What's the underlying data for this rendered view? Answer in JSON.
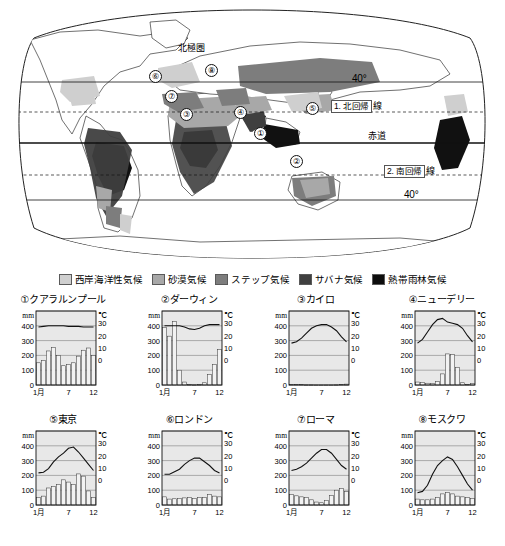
{
  "map": {
    "labels": [
      {
        "name": "arctic-circle",
        "text": "北極圏",
        "x": 178,
        "y": 44
      },
      {
        "name": "latitude-40-north",
        "text": "40°",
        "x": 352,
        "y": 78
      },
      {
        "name": "tropic-of-cancer",
        "prefix": "1. 北回帰",
        "suffix": "線",
        "x": 331,
        "y": 103
      },
      {
        "name": "equator",
        "text": "赤道",
        "x": 368,
        "y": 140
      },
      {
        "name": "tropic-of-capricorn",
        "prefix": "2. 南回帰",
        "suffix": "線",
        "x": 384,
        "y": 168
      },
      {
        "name": "latitude-40-south",
        "text": "40°",
        "x": 404,
        "y": 192
      }
    ],
    "markers": [
      {
        "id": "1",
        "label": "①",
        "x": 254,
        "y": 127
      },
      {
        "id": "2",
        "label": "②",
        "x": 290,
        "y": 155
      },
      {
        "id": "3",
        "label": "③",
        "x": 180,
        "y": 108
      },
      {
        "id": "4",
        "label": "④",
        "x": 234,
        "y": 106
      },
      {
        "id": "5",
        "label": "⑤",
        "x": 306,
        "y": 102
      },
      {
        "id": "6",
        "label": "⑥",
        "x": 149,
        "y": 70
      },
      {
        "id": "7",
        "label": "⑦",
        "x": 165,
        "y": 90
      },
      {
        "id": "8",
        "label": "⑧",
        "x": 205,
        "y": 64
      }
    ]
  },
  "legend": {
    "items": [
      {
        "label": "西岸海洋性気候",
        "color": "#cfcfcf"
      },
      {
        "label": "砂漠気候",
        "color": "#a8a8a8"
      },
      {
        "label": "ステップ気候",
        "color": "#7d7d7d"
      },
      {
        "label": "サバナ気候",
        "color": "#3f3f3f"
      },
      {
        "label": "熱帯雨林気候",
        "color": "#0d0d0d"
      }
    ]
  },
  "chart_common": {
    "type": "bar",
    "left_axis_unit": "mm",
    "right_axis_unit": "℃",
    "left_ticks": [
      "400",
      "300",
      "200",
      "100",
      "0"
    ],
    "right_ticks": [
      "30",
      "20",
      "10",
      "0"
    ],
    "x_ticks": [
      "1月",
      "7",
      "12"
    ],
    "precip_range": [
      0,
      500
    ],
    "temp_range": [
      -20,
      40
    ],
    "grid": true,
    "legend_position": "none"
  },
  "chart_data": [
    {
      "type": "bar",
      "id": "1",
      "title": "①クアラルンプール",
      "city": "クアラルンプール",
      "categories": [
        "1",
        "2",
        "3",
        "4",
        "5",
        "6",
        "7",
        "8",
        "9",
        "10",
        "11",
        "12"
      ],
      "series": [
        {
          "name": "降水量",
          "unit": "mm",
          "type": "bar",
          "values": [
            150,
            165,
            230,
            255,
            200,
            130,
            140,
            150,
            195,
            235,
            250,
            200
          ]
        },
        {
          "name": "気温",
          "unit": "℃",
          "type": "line",
          "values": [
            27,
            27.5,
            28,
            28,
            28,
            28,
            27.5,
            27.5,
            27.5,
            27,
            27,
            27
          ]
        }
      ],
      "xlabel": "",
      "ylabel": "mm",
      "y2label": "℃",
      "ylim": [
        0,
        500
      ],
      "y2lim": [
        -20,
        40
      ]
    },
    {
      "type": "bar",
      "id": "2",
      "title": "②ダーウィン",
      "city": "ダーウィン",
      "categories": [
        "1",
        "2",
        "3",
        "4",
        "5",
        "6",
        "7",
        "8",
        "9",
        "10",
        "11",
        "12"
      ],
      "series": [
        {
          "name": "降水量",
          "unit": "mm",
          "type": "bar",
          "values": [
            390,
            330,
            430,
            100,
            20,
            2,
            1,
            2,
            15,
            70,
            140,
            240
          ]
        },
        {
          "name": "気温",
          "unit": "℃",
          "type": "line",
          "values": [
            28,
            28,
            28,
            28,
            27,
            25.5,
            25,
            26,
            28,
            29,
            29,
            29
          ]
        }
      ],
      "xlabel": "",
      "ylabel": "mm",
      "y2label": "℃",
      "ylim": [
        0,
        500
      ],
      "y2lim": [
        -20,
        40
      ]
    },
    {
      "type": "bar",
      "id": "3",
      "title": "③カイロ",
      "city": "カイロ",
      "categories": [
        "1",
        "2",
        "3",
        "4",
        "5",
        "6",
        "7",
        "8",
        "9",
        "10",
        "11",
        "12"
      ],
      "series": [
        {
          "name": "降水量",
          "unit": "mm",
          "type": "bar",
          "values": [
            5,
            4,
            4,
            1,
            1,
            0,
            0,
            0,
            0,
            1,
            3,
            6
          ]
        },
        {
          "name": "気温",
          "unit": "℃",
          "type": "line",
          "values": [
            14,
            15,
            18,
            22,
            26,
            28,
            29,
            29,
            27,
            24,
            19,
            15
          ]
        }
      ],
      "xlabel": "",
      "ylabel": "mm",
      "y2label": "℃",
      "ylim": [
        0,
        500
      ],
      "y2lim": [
        -20,
        40
      ]
    },
    {
      "type": "bar",
      "id": "4",
      "title": "④ニューデリー",
      "city": "ニューデリー",
      "categories": [
        "1",
        "2",
        "3",
        "4",
        "5",
        "6",
        "7",
        "8",
        "9",
        "10",
        "11",
        "12"
      ],
      "series": [
        {
          "name": "降水量",
          "unit": "mm",
          "type": "bar",
          "values": [
            20,
            18,
            12,
            10,
            22,
            75,
            210,
            205,
            120,
            15,
            5,
            10
          ]
        },
        {
          "name": "気温",
          "unit": "℃",
          "type": "line",
          "values": [
            14,
            17,
            23,
            29,
            33,
            34,
            31,
            30,
            29,
            26,
            20,
            15
          ]
        }
      ],
      "xlabel": "",
      "ylabel": "mm",
      "y2label": "℃",
      "ylim": [
        0,
        500
      ],
      "y2lim": [
        -20,
        40
      ]
    },
    {
      "type": "bar",
      "id": "5",
      "title": "⑤東京",
      "city": "東京",
      "categories": [
        "1",
        "2",
        "3",
        "4",
        "5",
        "6",
        "7",
        "8",
        "9",
        "10",
        "11",
        "12"
      ],
      "series": [
        {
          "name": "降水量",
          "unit": "mm",
          "type": "bar",
          "values": [
            50,
            60,
            115,
            125,
            140,
            170,
            155,
            140,
            210,
            195,
            95,
            50
          ]
        },
        {
          "name": "気温",
          "unit": "℃",
          "type": "line",
          "values": [
            6,
            6.5,
            9.5,
            15,
            19,
            22,
            26,
            27,
            23,
            18,
            13,
            8
          ]
        }
      ],
      "xlabel": "",
      "ylabel": "mm",
      "y2label": "℃",
      "ylim": [
        0,
        500
      ],
      "y2lim": [
        -20,
        40
      ]
    },
    {
      "type": "bar",
      "id": "6",
      "title": "⑥ロンドン",
      "city": "ロンドン",
      "categories": [
        "1",
        "2",
        "3",
        "4",
        "5",
        "6",
        "7",
        "8",
        "9",
        "10",
        "11",
        "12"
      ],
      "series": [
        {
          "name": "降水量",
          "unit": "mm",
          "type": "bar",
          "values": [
            55,
            40,
            42,
            45,
            48,
            50,
            45,
            50,
            50,
            70,
            60,
            55
          ]
        },
        {
          "name": "気温",
          "unit": "℃",
          "type": "line",
          "values": [
            5,
            5,
            7,
            9,
            13,
            16,
            18,
            18,
            15,
            12,
            8,
            6
          ]
        }
      ],
      "xlabel": "",
      "ylabel": "mm",
      "y2label": "℃",
      "ylim": [
        0,
        500
      ],
      "y2lim": [
        -20,
        40
      ]
    },
    {
      "type": "bar",
      "id": "7",
      "title": "⑦ローマ",
      "city": "ローマ",
      "categories": [
        "1",
        "2",
        "3",
        "4",
        "5",
        "6",
        "7",
        "8",
        "9",
        "10",
        "11",
        "12"
      ],
      "series": [
        {
          "name": "降水量",
          "unit": "mm",
          "type": "bar",
          "values": [
            70,
            62,
            55,
            50,
            35,
            20,
            15,
            30,
            65,
            100,
            110,
            90
          ]
        },
        {
          "name": "気温",
          "unit": "℃",
          "type": "line",
          "values": [
            8,
            9,
            11,
            14,
            18,
            22,
            25,
            25,
            22,
            17,
            12,
            9
          ]
        }
      ],
      "xlabel": "",
      "ylabel": "mm",
      "y2label": "℃",
      "ylim": [
        0,
        500
      ],
      "y2lim": [
        -20,
        40
      ]
    },
    {
      "type": "bar",
      "id": "8",
      "title": "⑧モスクワ",
      "city": "モスクワ",
      "categories": [
        "1",
        "2",
        "3",
        "4",
        "5",
        "6",
        "7",
        "8",
        "9",
        "10",
        "11",
        "12"
      ],
      "series": [
        {
          "name": "降水量",
          "unit": "mm",
          "type": "bar",
          "values": [
            40,
            35,
            35,
            40,
            50,
            75,
            85,
            75,
            60,
            55,
            50,
            45
          ]
        },
        {
          "name": "気温",
          "unit": "℃",
          "type": "line",
          "values": [
            -10,
            -9,
            -4,
            5,
            12,
            16,
            19,
            17,
            11,
            4,
            -3,
            -8
          ]
        }
      ],
      "xlabel": "",
      "ylabel": "mm",
      "y2label": "℃",
      "ylim": [
        0,
        500
      ],
      "y2lim": [
        -20,
        40
      ]
    }
  ]
}
